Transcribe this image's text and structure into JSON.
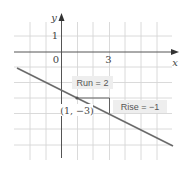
{
  "chart_data": {
    "type": "line",
    "title": "",
    "xlabel": "x",
    "ylabel": "y",
    "x_tick_labels": [
      {
        "value": 0,
        "label": "0"
      },
      {
        "value": 3,
        "label": "3"
      }
    ],
    "y_tick_labels": [
      {
        "value": 1,
        "label": "1"
      }
    ],
    "xlim": [
      -3,
      7
    ],
    "ylim": [
      -7,
      2
    ],
    "grid": true,
    "series": [
      {
        "name": "line",
        "slope": -0.5,
        "intercept": -2.5,
        "x": [
          -2.8,
          7.2
        ],
        "y": [
          -1.1,
          -6.1
        ]
      }
    ],
    "point": {
      "x": 1,
      "y": -3,
      "label": "(1, −3)"
    },
    "annotations": {
      "run": {
        "label": "Run = 2",
        "value": 2
      },
      "rise": {
        "label": "Rise = −1",
        "value": -1
      }
    }
  },
  "colors": {
    "grid": "#d4d4d4",
    "axis": "#555555",
    "line": "#6b6b6b",
    "label_bg": "#eeeeee",
    "text": "#444444"
  }
}
